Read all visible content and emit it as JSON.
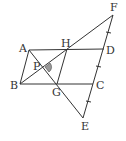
{
  "diagram": {
    "labels": {
      "A": "A",
      "B": "B",
      "C": "C",
      "D": "D",
      "E": "E",
      "F": "F",
      "G": "G",
      "H": "H",
      "P": "P"
    },
    "colors": {
      "line": "#333333",
      "angle_fill": "#999999"
    }
  }
}
